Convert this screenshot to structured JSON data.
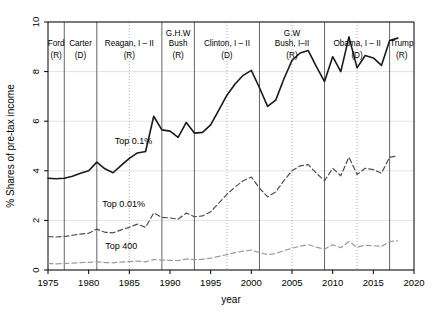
{
  "chart_data": {
    "type": "line",
    "title": "",
    "xlabel": "year",
    "ylabel": "% Shares of pre-tax income",
    "xlim": [
      1975,
      2020
    ],
    "ylim": [
      0,
      10
    ],
    "xticks": [
      1975,
      1980,
      1985,
      1990,
      1995,
      2000,
      2005,
      2010,
      2015,
      2020
    ],
    "yticks": [
      0,
      2,
      4,
      6,
      8,
      10
    ],
    "grid": true,
    "legend_position": "inline-annotations",
    "series": [
      {
        "name": "Top 0.1%",
        "style": "solid",
        "color": "#1a1a1a",
        "label_x": 1985.5,
        "label_y": 5.1,
        "x": [
          1975,
          1976,
          1977,
          1978,
          1979,
          1980,
          1981,
          1982,
          1983,
          1984,
          1985,
          1986,
          1987,
          1988,
          1989,
          1990,
          1991,
          1992,
          1993,
          1994,
          1995,
          1996,
          1997,
          1998,
          1999,
          2000,
          2001,
          2002,
          2003,
          2004,
          2005,
          2006,
          2007,
          2008,
          2009,
          2010,
          2011,
          2012,
          2013,
          2014,
          2015,
          2016,
          2017,
          2018
        ],
        "values": [
          3.7,
          3.68,
          3.7,
          3.78,
          3.9,
          4.0,
          4.35,
          4.08,
          3.92,
          4.22,
          4.5,
          4.72,
          4.78,
          6.2,
          5.65,
          5.6,
          5.35,
          5.95,
          5.52,
          5.55,
          5.85,
          6.45,
          7.05,
          7.5,
          7.85,
          8.05,
          7.35,
          6.6,
          6.85,
          7.7,
          8.45,
          8.75,
          8.85,
          8.2,
          7.6,
          8.6,
          8.0,
          9.4,
          8.15,
          8.65,
          8.55,
          8.25,
          9.25,
          9.35
        ]
      },
      {
        "name": "Top 0.01%",
        "style": "dashed",
        "color": "#4d4d4d",
        "label_x": 1984.3,
        "label_y": 2.55,
        "x": [
          1975,
          1976,
          1977,
          1978,
          1979,
          1980,
          1981,
          1982,
          1983,
          1984,
          1985,
          1986,
          1987,
          1988,
          1989,
          1990,
          1991,
          1992,
          1993,
          1994,
          1995,
          1996,
          1997,
          1998,
          1999,
          2000,
          2001,
          2002,
          2003,
          2004,
          2005,
          2006,
          2007,
          2008,
          2009,
          2010,
          2011,
          2012,
          2013,
          2014,
          2015,
          2016,
          2017,
          2018
        ],
        "values": [
          1.35,
          1.33,
          1.35,
          1.4,
          1.45,
          1.48,
          1.65,
          1.52,
          1.5,
          1.62,
          1.72,
          1.85,
          1.72,
          2.3,
          2.12,
          2.1,
          2.05,
          2.3,
          2.15,
          2.18,
          2.35,
          2.7,
          3.05,
          3.35,
          3.6,
          3.75,
          3.3,
          2.95,
          3.15,
          3.6,
          4.0,
          4.2,
          4.25,
          3.9,
          3.6,
          4.1,
          3.8,
          4.55,
          3.85,
          4.1,
          4.05,
          3.9,
          4.55,
          4.6
        ]
      },
      {
        "name": "Top 400",
        "style": "dashed",
        "color": "#9a9a9a",
        "label_x": 1984.0,
        "label_y": 0.84,
        "x": [
          1975,
          1976,
          1977,
          1978,
          1979,
          1980,
          1981,
          1982,
          1983,
          1984,
          1985,
          1986,
          1987,
          1988,
          1989,
          1990,
          1991,
          1992,
          1993,
          1994,
          1995,
          1996,
          1997,
          1998,
          1999,
          2000,
          2001,
          2002,
          2003,
          2004,
          2005,
          2006,
          2007,
          2008,
          2009,
          2010,
          2011,
          2012,
          2013,
          2014,
          2015,
          2016,
          2017,
          2018
        ],
        "values": [
          0.26,
          0.25,
          0.26,
          0.28,
          0.3,
          0.31,
          0.33,
          0.3,
          0.29,
          0.32,
          0.34,
          0.36,
          0.33,
          0.42,
          0.4,
          0.39,
          0.38,
          0.44,
          0.42,
          0.43,
          0.48,
          0.55,
          0.62,
          0.7,
          0.76,
          0.8,
          0.7,
          0.62,
          0.66,
          0.78,
          0.88,
          0.96,
          1.02,
          0.92,
          0.84,
          1.02,
          0.9,
          1.15,
          0.92,
          1.0,
          0.98,
          0.95,
          1.15,
          1.18
        ]
      }
    ],
    "presidents": [
      {
        "name": "Ford",
        "party": "(R)",
        "start": 1975.0,
        "end": 1977.0,
        "label_x": 1976.0,
        "boundary": 1977.0,
        "boundary_style": "solid"
      },
      {
        "name": "Carter",
        "party": "(D)",
        "start": 1977.0,
        "end": 1981.0,
        "label_x": 1979.0,
        "boundary": 1981.0,
        "boundary_style": "solid"
      },
      {
        "name": "Reagan, I – II",
        "party": "(R)",
        "start": 1981.0,
        "end": 1989.0,
        "label_x": 1985.0,
        "boundary": 1989.0,
        "boundary_style": "solid",
        "midterm": 1985.0
      },
      {
        "name": "G.H.W\nBush",
        "party": "(R)",
        "start": 1989.0,
        "end": 1993.0,
        "label_x": 1991.0,
        "boundary": 1993.0,
        "boundary_style": "solid"
      },
      {
        "name": "Clinton, I – II",
        "party": "(D)",
        "start": 1993.0,
        "end": 2001.0,
        "label_x": 1997.0,
        "boundary": 2001.0,
        "boundary_style": "solid",
        "midterm": 1997.0
      },
      {
        "name": "G.W\nBush, I–II",
        "party": "(R)",
        "start": 2001.0,
        "end": 2009.0,
        "label_x": 2005.0,
        "boundary": 2009.0,
        "boundary_style": "solid",
        "midterm": 2005.0
      },
      {
        "name": "Obama, I – II",
        "party": "(D)",
        "start": 2009.0,
        "end": 2017.0,
        "label_x": 2013.0,
        "boundary": 2017.0,
        "boundary_style": "solid",
        "midterm": 2013.0
      },
      {
        "name": "Trump",
        "party": "(R)",
        "start": 2017.0,
        "end": 2020.0,
        "label_x": 2018.5,
        "boundary": null,
        "boundary_style": null
      }
    ]
  }
}
